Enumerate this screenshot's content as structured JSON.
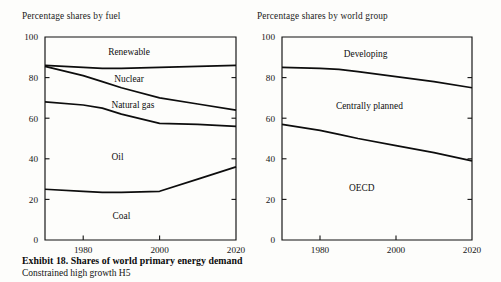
{
  "figure": {
    "caption_main": "Exhibit 18. Shares of world primary energy demand",
    "caption_sub": "Constrained high growth H5"
  },
  "panels": {
    "fuel": {
      "title": "Percentage shares by fuel"
    },
    "group": {
      "title": "Percentage shares by world group"
    }
  },
  "chart_data": [
    {
      "id": "fuel",
      "type": "area",
      "title": "Percentage shares by fuel",
      "xlabel": "",
      "ylabel": "",
      "xlim": [
        1970,
        2020
      ],
      "ylim": [
        0,
        100
      ],
      "xticks": [
        1980,
        2000,
        2020
      ],
      "xtick_labels": [
        "1980",
        "2000",
        "2020"
      ],
      "yticks": [
        0,
        20,
        40,
        60,
        80,
        100
      ],
      "ytick_labels": [
        "0",
        "20",
        "40",
        "60",
        "80",
        "100"
      ],
      "grid": false,
      "legend": "inline-band-labels",
      "x": [
        1970,
        1980,
        1985,
        1990,
        2000,
        2010,
        2020
      ],
      "series": [
        {
          "name": "Coal",
          "label": "Coal",
          "boundary_values": [
            25,
            24,
            23.5,
            23.5,
            24,
            30,
            36
          ]
        },
        {
          "name": "Oil",
          "label": "Oil",
          "boundary_values": [
            68,
            66.5,
            65,
            62,
            57.5,
            57,
            56
          ]
        },
        {
          "name": "Natural gas",
          "label": "Natural gas",
          "boundary_values": [
            85.5,
            81,
            78,
            75,
            70,
            67,
            64
          ]
        },
        {
          "name": "Nuclear",
          "label": "Nuclear",
          "boundary_values": [
            86,
            85,
            84.5,
            84.5,
            85,
            85.5,
            86
          ]
        },
        {
          "name": "Renewable",
          "label": "Renewable",
          "boundary_values": [
            100,
            100,
            100,
            100,
            100,
            100,
            100
          ]
        }
      ],
      "band_labels": [
        {
          "text": "Renewable",
          "x": 1992,
          "y": 93
        },
        {
          "text": "Nuclear",
          "x": 1992,
          "y": 79.5
        },
        {
          "text": "Natural gas",
          "x": 1993,
          "y": 66.5
        },
        {
          "text": "Oil",
          "x": 1989,
          "y": 41
        },
        {
          "text": "Coal",
          "x": 1990,
          "y": 12
        }
      ]
    },
    {
      "id": "group",
      "type": "area",
      "title": "Percentage shares by world group",
      "xlabel": "",
      "ylabel": "",
      "xlim": [
        1970,
        2020
      ],
      "ylim": [
        0,
        100
      ],
      "xticks": [
        1980,
        2000,
        2020
      ],
      "xtick_labels": [
        "1980",
        "2000",
        "2020"
      ],
      "yticks": [
        0,
        20,
        40,
        60,
        80,
        100
      ],
      "ytick_labels": [
        "0",
        "20",
        "40",
        "60",
        "80",
        "100"
      ],
      "grid": false,
      "legend": "inline-band-labels",
      "x": [
        1970,
        1980,
        1985,
        1990,
        2000,
        2010,
        2020
      ],
      "series": [
        {
          "name": "OECD",
          "label": "OECD",
          "boundary_values": [
            57,
            54,
            52,
            50,
            46.5,
            43,
            39
          ]
        },
        {
          "name": "Centrally planned",
          "label": "Centrally planned",
          "boundary_values": [
            85,
            84.5,
            84,
            83,
            80.5,
            78,
            75
          ]
        },
        {
          "name": "Developing",
          "label": "Developing",
          "boundary_values": [
            100,
            100,
            100,
            100,
            100,
            100,
            100
          ]
        }
      ],
      "band_labels": [
        {
          "text": "Developing",
          "x": 1992,
          "y": 92
        },
        {
          "text": "Centrally planned",
          "x": 1993,
          "y": 66
        },
        {
          "text": "OECD",
          "x": 1991,
          "y": 26
        }
      ]
    }
  ]
}
